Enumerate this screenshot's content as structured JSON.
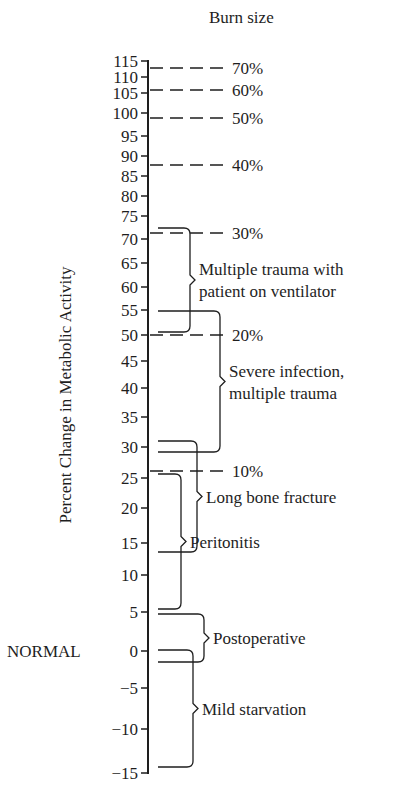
{
  "chart_data": {
    "type": "table",
    "title": "Burn size",
    "ylabel": "Percent Change in Metabolic Activity",
    "normal_label": "NORMAL",
    "ylim": [
      -15,
      115
    ],
    "ticks": [
      {
        "v": "115",
        "y": 61
      },
      {
        "v": "110",
        "y": 77
      },
      {
        "v": "105",
        "y": 93
      },
      {
        "v": "100",
        "y": 113
      },
      {
        "v": "95",
        "y": 136
      },
      {
        "v": "90",
        "y": 156
      },
      {
        "v": "85",
        "y": 176
      },
      {
        "v": "80",
        "y": 196
      },
      {
        "v": "75",
        "y": 216
      },
      {
        "v": "70",
        "y": 239
      },
      {
        "v": "65",
        "y": 263
      },
      {
        "v": "60",
        "y": 287
      },
      {
        "v": "55",
        "y": 310
      },
      {
        "v": "50",
        "y": 335
      },
      {
        "v": "45",
        "y": 361
      },
      {
        "v": "40",
        "y": 388
      },
      {
        "v": "35",
        "y": 417
      },
      {
        "v": "30",
        "y": 447
      },
      {
        "v": "25",
        "y": 478
      },
      {
        "v": "20",
        "y": 508
      },
      {
        "v": "15",
        "y": 543
      },
      {
        "v": "10",
        "y": 575
      },
      {
        "v": "5",
        "y": 612
      },
      {
        "v": "0",
        "y": 651
      },
      {
        "v": "−5",
        "y": 688
      },
      {
        "v": "−10",
        "y": 729
      },
      {
        "v": "−15",
        "y": 773
      }
    ],
    "burn_sizes": [
      {
        "label": "70%",
        "y": 68
      },
      {
        "label": "60%",
        "y": 90
      },
      {
        "label": "50%",
        "y": 118
      },
      {
        "label": "40%",
        "y": 165
      },
      {
        "label": "30%",
        "y": 233
      },
      {
        "label": "20%",
        "y": 335
      },
      {
        "label": "10%",
        "y": 471
      }
    ],
    "conditions": [
      {
        "label": [
          "Multiple trauma with",
          "patient on ventilator"
        ],
        "range": [
          50,
          73
        ],
        "top": 228,
        "bot": 332,
        "x": 190
      },
      {
        "label": [
          "Severe infection,",
          "multiple trauma"
        ],
        "range": [
          29,
          55
        ],
        "top": 311,
        "bot": 452,
        "x": 220
      },
      {
        "label": [
          "Long bone fracture"
        ],
        "range": [
          14,
          31
        ],
        "top": 441,
        "bot": 552,
        "x": 197
      },
      {
        "label": [
          "Peritonitis"
        ],
        "range": [
          5,
          26
        ],
        "top": 474,
        "bot": 609,
        "x": 181
      },
      {
        "label": [
          "Postoperative"
        ],
        "range": [
          -2,
          5
        ],
        "top": 614,
        "bot": 662,
        "x": 204
      },
      {
        "label": [
          "Mild starvation"
        ],
        "range": [
          -15,
          0
        ],
        "top": 650,
        "bot": 767,
        "x": 193
      }
    ]
  }
}
